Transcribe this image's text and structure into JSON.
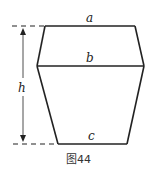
{
  "labels": {
    "a": "a",
    "b": "b",
    "c": "c",
    "h": "h"
  },
  "caption": "图44",
  "colors": {
    "stroke": "#222222"
  }
}
